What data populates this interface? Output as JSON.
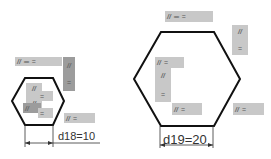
{
  "symbols": {
    "parallel": "//",
    "flush": "═",
    "equal": "="
  },
  "left_shape": {
    "dimension_label": "d18=10"
  },
  "right_shape": {
    "dimension_label": "d19=20"
  },
  "colors": {
    "outline": "#111111",
    "tag_bg": "#c8c8c8",
    "tag_dark": "#9c9c9c"
  }
}
